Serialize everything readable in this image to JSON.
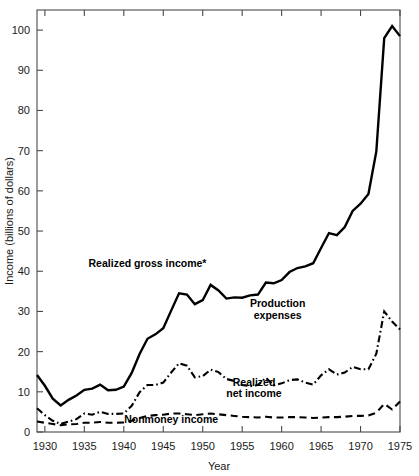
{
  "chart_data": {
    "type": "line",
    "title": "",
    "xlabel": "Year",
    "ylabel": "Income (billions of dollars)",
    "xlim": [
      1929,
      1975
    ],
    "ylim": [
      0,
      105
    ],
    "xticks": [
      1930,
      1935,
      1940,
      1945,
      1950,
      1955,
      1960,
      1965,
      1970,
      1975
    ],
    "xtick_labels": [
      "1930",
      "1935",
      "1940",
      "1945",
      "1950",
      "1955",
      "1960",
      "1965",
      "1970",
      "1975"
    ],
    "yticks": [
      0,
      10,
      20,
      30,
      40,
      50,
      60,
      70,
      80,
      90,
      100
    ],
    "ytick_labels": [
      "0",
      "10",
      "20",
      "30",
      "40",
      "50",
      "60",
      "70",
      "80",
      "90",
      "100"
    ],
    "grid": false,
    "legend_position": "inline-annotations",
    "x": [
      1929,
      1930,
      1931,
      1932,
      1933,
      1934,
      1935,
      1936,
      1937,
      1938,
      1939,
      1940,
      1941,
      1942,
      1943,
      1944,
      1945,
      1946,
      1947,
      1948,
      1949,
      1950,
      1951,
      1952,
      1953,
      1954,
      1955,
      1956,
      1957,
      1958,
      1959,
      1960,
      1961,
      1962,
      1963,
      1964,
      1965,
      1966,
      1967,
      1968,
      1969,
      1970,
      1971,
      1972,
      1973,
      1974,
      1975
    ],
    "series": [
      {
        "name": "Realized gross income*",
        "style": "solid",
        "color": "#000000",
        "values": [
          14.2,
          11.5,
          8.3,
          6.6,
          8.0,
          9.1,
          10.5,
          10.8,
          11.8,
          10.4,
          10.5,
          11.3,
          14.7,
          19.4,
          23.2,
          24.3,
          25.8,
          30.2,
          34.5,
          34.2,
          31.8,
          32.8,
          36.6,
          35.2,
          33.2,
          33.5,
          33.4,
          34.0,
          34.2,
          37.2,
          37.0,
          37.8,
          39.8,
          40.8,
          41.2,
          42.0,
          45.8,
          49.5,
          49.0,
          51.0,
          55.0,
          56.8,
          59.2,
          69.8,
          98.0,
          101.0,
          98.5
        ]
      },
      {
        "name": "Realized net income",
        "style": "dashdot",
        "color": "#000000",
        "values": [
          5.9,
          4.2,
          2.8,
          2.0,
          2.6,
          3.2,
          4.6,
          4.3,
          5.0,
          4.5,
          4.5,
          4.6,
          6.5,
          9.9,
          11.7,
          11.7,
          12.3,
          14.8,
          17.1,
          16.5,
          13.6,
          13.9,
          15.5,
          14.9,
          13.2,
          12.7,
          11.7,
          11.4,
          11.7,
          13.5,
          11.6,
          12.1,
          12.9,
          13.1,
          12.3,
          11.8,
          14.1,
          15.6,
          14.3,
          14.8,
          16.2,
          15.6,
          15.6,
          19.5,
          30.0,
          27.5,
          25.5
        ]
      },
      {
        "name": "Nonmoney income",
        "style": "dashed",
        "color": "#000000",
        "values": [
          2.6,
          2.3,
          2.0,
          1.7,
          1.9,
          2.0,
          2.3,
          2.3,
          2.5,
          2.3,
          2.3,
          2.4,
          2.8,
          3.5,
          4.0,
          4.2,
          4.3,
          4.6,
          4.6,
          4.4,
          4.2,
          4.4,
          4.6,
          4.4,
          4.2,
          4.0,
          3.8,
          3.7,
          3.6,
          3.8,
          3.6,
          3.6,
          3.7,
          3.7,
          3.6,
          3.5,
          3.6,
          3.7,
          3.7,
          3.8,
          4.0,
          4.0,
          4.1,
          4.8,
          7.0,
          5.6,
          7.6
        ]
      }
    ],
    "annotations": [
      {
        "text": "Realized gross income*",
        "x": 1943.0,
        "y": 41.0
      },
      {
        "text": "Production",
        "x": 1959.5,
        "y": 31.0
      },
      {
        "text": "expenses",
        "x": 1959.5,
        "y": 28.0
      },
      {
        "text": "Realized",
        "x": 1956.5,
        "y": 11.5
      },
      {
        "text": "net income",
        "x": 1956.5,
        "y": 8.6
      },
      {
        "text": "Nonmoney income",
        "x": 1946.0,
        "y": 2.2
      }
    ]
  }
}
